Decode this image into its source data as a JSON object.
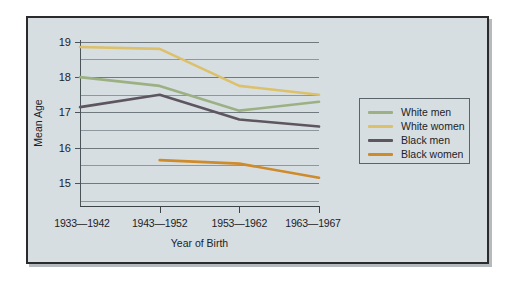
{
  "chart_data": {
    "type": "line",
    "title": "",
    "xlabel": "Year of Birth",
    "ylabel": "Mean Age",
    "categories": [
      "1933—1942",
      "1943—1952",
      "1953—1962",
      "1963—1967"
    ],
    "ylim": [
      14.35,
      19.05
    ],
    "yticks": [
      15,
      16,
      17,
      18,
      19
    ],
    "ytick_labels": [
      "15",
      "16",
      "17",
      "18",
      "19"
    ],
    "gridlines": [
      14.5,
      15.0,
      15.5,
      16.0,
      16.5,
      17.0,
      17.5,
      18.0,
      18.5,
      19.0
    ],
    "grid": true,
    "legend_position": "right",
    "series": [
      {
        "name": "White men",
        "color": "#9cb183",
        "values": [
          18.0,
          17.75,
          17.05,
          17.3
        ]
      },
      {
        "name": "White women",
        "color": "#d9b košt"
      }
    ]
  }
}
